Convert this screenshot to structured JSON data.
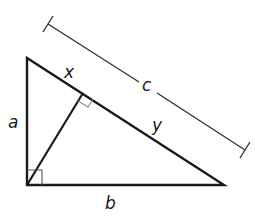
{
  "diagram": {
    "type": "right-triangle-with-altitude",
    "labels": {
      "leg_vertical": "a",
      "leg_horizontal": "b",
      "hypotenuse": "c",
      "hyp_segment_upper": "x",
      "hyp_segment_lower": "y"
    },
    "colors": {
      "stroke": "#1a1a1a",
      "right_angle_marker": "#8a8a8a",
      "background": "#ffffff"
    }
  }
}
